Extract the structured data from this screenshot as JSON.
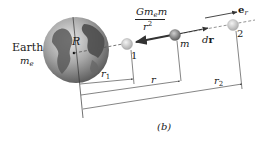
{
  "diagram": {
    "figure_label": "(b)",
    "earth": {
      "name": "Earth",
      "mass_symbol": "m",
      "mass_subscript": "e",
      "radius_label": "R"
    },
    "points": [
      {
        "id": "1",
        "label": "1"
      },
      {
        "id": "m",
        "label": "m"
      },
      {
        "id": "2",
        "label": "2"
      }
    ],
    "force": {
      "numerator_G": "Gm",
      "numerator_sub": "e",
      "numerator_m": "m",
      "denominator_r": "r",
      "denominator_exp": "2"
    },
    "displacement_label_d": "d",
    "displacement_label_r": "r",
    "unit_vector_label": "e",
    "unit_vector_sub": "r",
    "dimensions": {
      "r1": {
        "symbol": "r",
        "sub": "1"
      },
      "r": {
        "symbol": "r"
      },
      "r2": {
        "symbol": "r",
        "sub": "2"
      }
    },
    "colors": {
      "line": "#333333",
      "earth_ocean": "#9a9a9a",
      "earth_land": "#555555",
      "sphere_light": "#d8d8d8",
      "sphere_mid": "#8a8a8a"
    }
  }
}
